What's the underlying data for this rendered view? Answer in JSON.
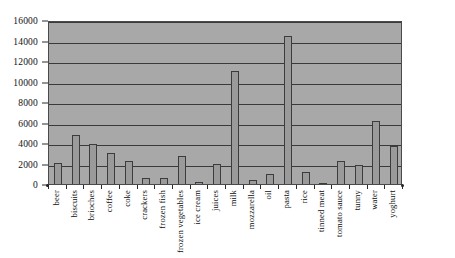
{
  "chart_data": {
    "type": "bar",
    "title": "",
    "subtitle": "",
    "xlabel": "",
    "ylabel": "",
    "ylim": [
      0,
      16000
    ],
    "ytick_interval": 2000,
    "yticks": [
      0,
      2000,
      4000,
      6000,
      8000,
      10000,
      12000,
      14000,
      16000
    ],
    "ytick_labels": [
      "0",
      "2000",
      "4000",
      "6000",
      "8000",
      "10000",
      "12000",
      "14000",
      "16000"
    ],
    "grid": true,
    "grid_axis": "y",
    "legend": false,
    "legend_position": "none",
    "categories": [
      "beer",
      "biscuits",
      "brioches",
      "coffee",
      "coke",
      "crackers",
      "frozen fish",
      "frozen vegetables",
      "ice cream",
      "juices",
      "milk",
      "mozzarella",
      "oil",
      "pasta",
      "rice",
      "tinned meat",
      "tomato sauce",
      "tunny",
      "water",
      "yoghurt"
    ],
    "values": [
      2050,
      4800,
      3950,
      3000,
      2200,
      600,
      600,
      2700,
      200,
      2000,
      11000,
      350,
      1000,
      14400,
      1200,
      120,
      2250,
      1900,
      6100,
      3700
    ]
  },
  "style": {
    "plot_background": "#a8a8a8",
    "bar_fill": "#9a9a9a",
    "bar_border": "#3c3c3c",
    "gridline_color": "#3a3a3a",
    "axis_color": "#2a2a2a",
    "text_color": "#0d0d0d",
    "page_background": "#ffffff"
  }
}
